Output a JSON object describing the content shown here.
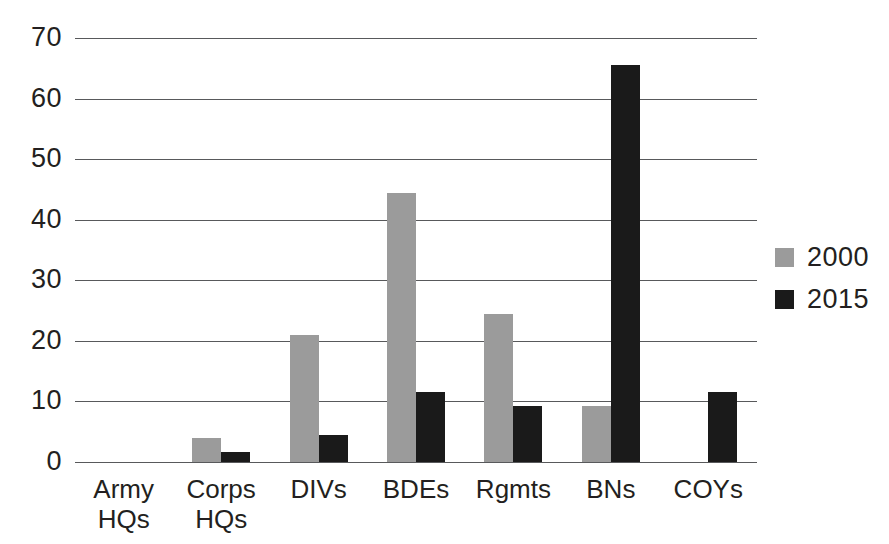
{
  "chart_data": {
    "type": "bar",
    "title": "",
    "subtitle": "",
    "xlabel": "",
    "ylabel": "",
    "categories": [
      "Army\nHQs",
      "Corps\nHQs",
      "DIVs",
      "BDEs",
      "Rgmts",
      "BNs",
      "COYs"
    ],
    "series": [
      {
        "name": "2000",
        "color": "#9b9b9b",
        "values": [
          0,
          4,
          21,
          44.4,
          24.5,
          9.2,
          0
        ]
      },
      {
        "name": "2015",
        "color": "#1a1a1a",
        "values": [
          0,
          1.6,
          4.5,
          11.5,
          9.2,
          65.5,
          11.5
        ]
      }
    ],
    "ylim": [
      0,
      70
    ],
    "yticks": [
      0,
      10,
      20,
      30,
      40,
      50,
      60,
      70
    ],
    "ytick_labels": [
      "0",
      "10",
      "20",
      "30",
      "40",
      "50",
      "60",
      "70"
    ],
    "grid": true,
    "grid_axis": "y",
    "legend": {
      "position": "right",
      "entries": [
        "2000",
        "2015"
      ]
    },
    "colors": {
      "series_2000": "#9b9b9b",
      "series_2015": "#1a1a1a",
      "grid": "#58595b",
      "text": "#231f20",
      "background": "#ffffff"
    }
  }
}
